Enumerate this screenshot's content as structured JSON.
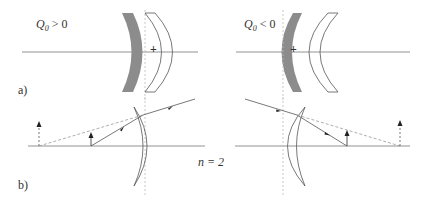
{
  "panel_a": {
    "label": "a)",
    "left": {
      "condition_symbol": "Q",
      "condition_subscript": "0",
      "condition_rest": " > 0",
      "center_mark": "+"
    },
    "right": {
      "condition_symbol": "Q",
      "condition_subscript": "0",
      "condition_rest": " < 0",
      "center_mark": "+"
    }
  },
  "panel_b": {
    "label": "b)",
    "refractive_index_label": "n = 2"
  },
  "colors": {
    "line": "#555555",
    "mirror_fill": "#8c8c8c",
    "dashed": "#999999",
    "axis": "#777777"
  }
}
